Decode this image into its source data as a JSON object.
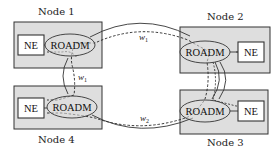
{
  "diagram": {
    "colors": {
      "node_fill": "#dedede",
      "stroke": "#333333",
      "background": "#ffffff"
    },
    "nodes": [
      {
        "id": "node1",
        "label": "Node 1",
        "ne": "NE",
        "roadm": "ROADM"
      },
      {
        "id": "node2",
        "label": "Node 2",
        "ne": "NE",
        "roadm": "ROADM"
      },
      {
        "id": "node3",
        "label": "Node 3",
        "ne": "NE",
        "roadm": "ROADM"
      },
      {
        "id": "node4",
        "label": "Node 4",
        "ne": "NE",
        "roadm": "ROADM"
      }
    ],
    "links": [
      {
        "from": "Node 1",
        "to": "Node 2",
        "style": "solid",
        "type": "fiber"
      },
      {
        "from": "Node 1",
        "to": "Node 4",
        "style": "solid",
        "type": "fiber"
      },
      {
        "from": "Node 4",
        "to": "Node 3",
        "style": "solid",
        "type": "fiber"
      },
      {
        "from": "Node 2",
        "to": "Node 3",
        "style": "solid",
        "type": "fiber"
      }
    ],
    "wavelength_paths": [
      {
        "label": "w",
        "subscript": "1",
        "route": [
          "Node 2",
          "Node 1",
          "Node 4"
        ],
        "style": "dashed"
      },
      {
        "label": "w",
        "subscript": "2",
        "route": [
          "Node 4",
          "Node 3",
          "Node 2"
        ],
        "style": "dashed"
      }
    ],
    "wavelength_labels": [
      {
        "text": "w",
        "sub": "1",
        "position": "top-link"
      },
      {
        "text": "w",
        "sub": "1",
        "position": "left-link"
      },
      {
        "text": "w",
        "sub": "2",
        "position": "bottom-link"
      }
    ]
  }
}
